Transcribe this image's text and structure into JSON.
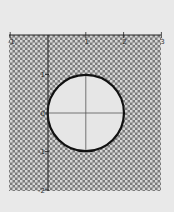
{
  "chart_data": {
    "type": "area",
    "title": "",
    "xlabel": "",
    "ylabel": "",
    "xlim": [
      -1,
      3
    ],
    "ylim": [
      -2,
      2
    ],
    "grid": false,
    "x_ticks": [
      {
        "value": -1,
        "label": "-1"
      },
      {
        "value": 1,
        "label": "1"
      },
      {
        "value": 2,
        "label": "2"
      },
      {
        "value": 3,
        "label": "3"
      }
    ],
    "y_ticks": [
      {
        "value": 1,
        "label": "1"
      },
      {
        "value": 0,
        "label": "0"
      },
      {
        "value": -1,
        "label": "-1"
      },
      {
        "value": -2,
        "label": "-2"
      }
    ],
    "shaded_region": {
      "description": "Region outside the circle (x-1)^2 + y^2 = 1",
      "fill_pattern": "checkerboard",
      "pattern_dark": "#7a7a7a",
      "pattern_light": "#d6d6d6"
    },
    "circle": {
      "center": [
        1,
        0
      ],
      "radius": 1,
      "stroke": "#111111",
      "fill": "#e6e6e6"
    },
    "inner_crosshair": {
      "horizontal_y": 0,
      "vertical_x": 1,
      "color": "#555555"
    }
  },
  "layout": {
    "plot_px": {
      "left": 9,
      "top": 35,
      "right": 161,
      "bottom": 191
    },
    "x_to_px": {
      "x0": 48,
      "unit": 37.8
    },
    "y_to_px": {
      "y0": 113,
      "unit": 38.5
    },
    "background": "#e9e9e9"
  }
}
